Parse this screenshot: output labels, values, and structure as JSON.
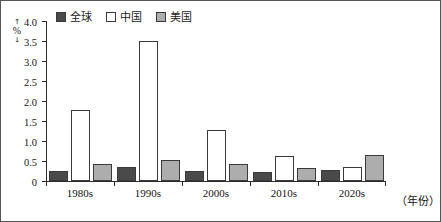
{
  "chart_data": {
    "type": "bar",
    "title": "",
    "subtitle": "",
    "xlabel": "（年份）",
    "ylabel": "（%）",
    "ylabel_unit": "%",
    "categories": [
      "1980s",
      "1990s",
      "2000s",
      "2010s",
      "2020s"
    ],
    "series": [
      {
        "name": "全球",
        "color": "#4a4a4a",
        "values": [
          0.25,
          0.35,
          0.25,
          0.22,
          0.27
        ]
      },
      {
        "name": "中国",
        "color": "#ffffff",
        "values": [
          1.78,
          3.52,
          1.28,
          0.62,
          0.36
        ]
      },
      {
        "name": "美国",
        "color": "#adadad",
        "values": [
          0.42,
          0.54,
          0.44,
          0.33,
          0.66
        ]
      }
    ],
    "ylim": [
      0,
      4.0
    ],
    "ytick_values": [
      0,
      0.5,
      1.0,
      1.5,
      2.0,
      2.5,
      3.0,
      3.5,
      4.0
    ],
    "ytick_labels": [
      "0",
      "0.5",
      "1.0",
      "1.5",
      "2.0",
      "2.5",
      "3.0",
      "3.5",
      "4.0"
    ],
    "grid": false,
    "legend_position": "top-left",
    "annotations": []
  },
  "legend": {
    "entries": [
      {
        "label": "全球",
        "color": "#4a4a4a"
      },
      {
        "label": "中国",
        "color": "#ffffff"
      },
      {
        "label": "美国",
        "color": "#adadad"
      }
    ]
  },
  "colors": {
    "global": "#4a4a4a",
    "china": "#ffffff",
    "usa": "#adadad",
    "axis": "#2b2b2b",
    "bar_outline": "#3a3a3a",
    "text": "#141414",
    "background": "#ffffff"
  }
}
